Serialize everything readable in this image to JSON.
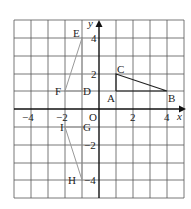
{
  "diagram": {
    "type": "coordinate-grid",
    "origin_label": "O",
    "x_axis_label": "x",
    "y_axis_label": "y",
    "x_range": [
      -5,
      5
    ],
    "y_range": [
      -5,
      5
    ],
    "x_ticks": [
      {
        "value": -4,
        "label": "−4"
      },
      {
        "value": -2,
        "label": "−2"
      },
      {
        "value": 2,
        "label": "2"
      },
      {
        "value": 4,
        "label": "4"
      }
    ],
    "y_ticks": [
      {
        "value": 4,
        "label": "4"
      },
      {
        "value": 2,
        "label": "2"
      },
      {
        "value": -2,
        "label": "−2"
      },
      {
        "value": -4,
        "label": "−4"
      }
    ],
    "points": [
      {
        "name": "E",
        "x": -1,
        "y": 4
      },
      {
        "name": "F",
        "x": -2,
        "y": 1
      },
      {
        "name": "D",
        "x": -1,
        "y": 1
      },
      {
        "name": "C",
        "x": 1,
        "y": 2
      },
      {
        "name": "A",
        "x": 1,
        "y": 1
      },
      {
        "name": "B",
        "x": 4,
        "y": 1
      },
      {
        "name": "I",
        "x": -2,
        "y": -1
      },
      {
        "name": "G",
        "x": -1,
        "y": -1
      },
      {
        "name": "H",
        "x": -1,
        "y": -4
      }
    ],
    "shapes": [
      {
        "name": "triangle-ABC",
        "vertices": [
          "A",
          "B",
          "C"
        ],
        "color": "#222222"
      },
      {
        "name": "triangle-DEF",
        "vertices": [
          "D",
          "E",
          "F"
        ],
        "color": "#999999"
      },
      {
        "name": "triangle-GHI",
        "vertices": [
          "G",
          "H",
          "I"
        ],
        "color": "#999999"
      }
    ],
    "colors": {
      "grid": "#555555",
      "axis": "#111111",
      "triangle_main": "#222222",
      "triangle_image": "#999999"
    }
  }
}
